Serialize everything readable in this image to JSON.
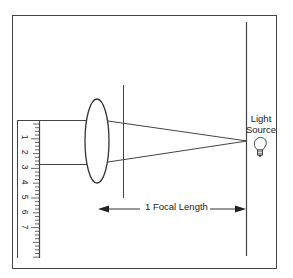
{
  "diagram": {
    "light_source": {
      "label_line1": "Light",
      "label_line2": "Source",
      "icon": "lightbulb-icon"
    },
    "focal_length": {
      "label": "1 Focal Length",
      "icon_left": "arrow-left-icon",
      "icon_right": "arrow-right-icon"
    },
    "ruler": {
      "numbers": [
        "1",
        "2",
        "3",
        "4",
        "5",
        "6",
        "7"
      ]
    },
    "colors": {
      "stroke": "#333333",
      "background": "#ffffff"
    }
  }
}
